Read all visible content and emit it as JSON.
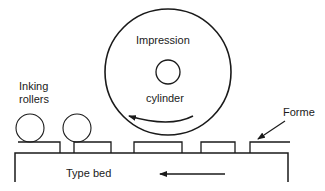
{
  "diagram": {
    "labels": {
      "impression": "Impression",
      "cylinder": "cylinder",
      "inking_line1": "Inking",
      "inking_line2": "rollers",
      "forme": "Forme",
      "type_bed": "Type bed"
    },
    "colors": {
      "stroke": "#1a1a1a",
      "background": "#ffffff"
    }
  }
}
